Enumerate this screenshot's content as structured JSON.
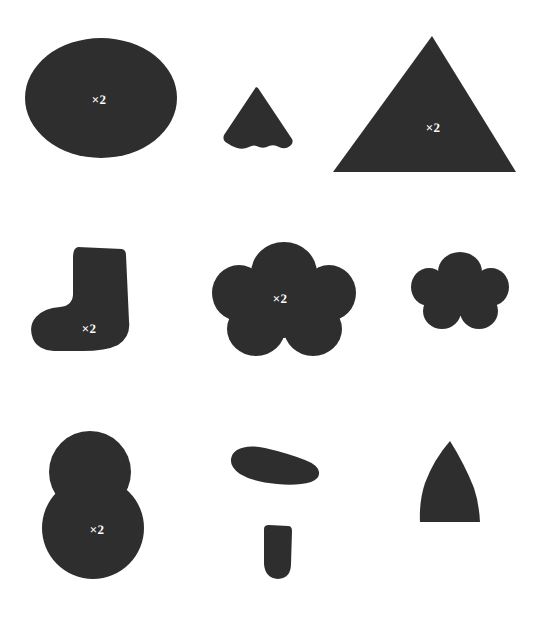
{
  "sheet": {
    "title": "Pattern Pieces Cutting Layout",
    "background_color": "#ffffff",
    "piece_fill_color": "#2e2e2e",
    "label_color": "#ffffff",
    "width": 540,
    "height": 619
  },
  "pieces": [
    {
      "id": "piece-ellipse",
      "name": "ellipse-piece",
      "row": 1,
      "column": 1,
      "shape": "ellipse",
      "quantity_label": "×2",
      "bbox": {
        "x": 25,
        "y": 38,
        "w": 152,
        "h": 120
      },
      "label_position": {
        "x": 99,
        "y": 99
      }
    },
    {
      "id": "piece-scalloped-cone",
      "name": "scalloped-cone-piece",
      "row": 1,
      "column": 2,
      "shape": "scalloped-cone",
      "quantity_label": "",
      "bbox": {
        "x": 218,
        "y": 87,
        "w": 78,
        "h": 64
      },
      "label_position": null
    },
    {
      "id": "piece-triangle",
      "name": "triangle-piece",
      "row": 1,
      "column": 3,
      "shape": "triangle",
      "quantity_label": "×2",
      "bbox": {
        "x": 333,
        "y": 36,
        "w": 183,
        "h": 137
      },
      "label_position": {
        "x": 433,
        "y": 127
      }
    },
    {
      "id": "piece-boot",
      "name": "boot-sock-piece",
      "row": 2,
      "column": 1,
      "shape": "boot",
      "quantity_label": "×2",
      "bbox": {
        "x": 30,
        "y": 247,
        "w": 102,
        "h": 104
      },
      "label_position": {
        "x": 89,
        "y": 328
      }
    },
    {
      "id": "piece-flower-large",
      "name": "large-flower-piece",
      "row": 2,
      "column": 2,
      "shape": "flower-5-petal",
      "quantity_label": "×2",
      "bbox": {
        "x": 213,
        "y": 240,
        "w": 142,
        "h": 116
      },
      "label_position": {
        "x": 280,
        "y": 298
      }
    },
    {
      "id": "piece-flower-small",
      "name": "small-flower-piece",
      "row": 2,
      "column": 3,
      "shape": "flower-5-petal",
      "quantity_label": "",
      "bbox": {
        "x": 412,
        "y": 251,
        "w": 96,
        "h": 78
      },
      "label_position": null
    },
    {
      "id": "piece-snowman",
      "name": "double-circle-snowman-piece",
      "row": 3,
      "column": 1,
      "shape": "two-stacked-circles",
      "quantity_label": "×2",
      "bbox": {
        "x": 42,
        "y": 431,
        "w": 102,
        "h": 148
      },
      "label_position": {
        "x": 97,
        "y": 529
      }
    },
    {
      "id": "piece-crescent",
      "name": "crescent-lip-piece",
      "row": 3,
      "column": 2,
      "shape": "crescent",
      "quantity_label": "",
      "bbox": {
        "x": 231,
        "y": 446,
        "w": 88,
        "h": 39
      },
      "label_position": null
    },
    {
      "id": "piece-tongue",
      "name": "rounded-tab-piece",
      "row": 3,
      "column": 2,
      "shape": "rounded-tab",
      "quantity_label": "",
      "bbox": {
        "x": 262,
        "y": 524,
        "w": 31,
        "h": 55
      },
      "label_position": null
    },
    {
      "id": "piece-arch",
      "name": "pointed-arch-piece",
      "row": 3,
      "column": 3,
      "shape": "pointed-arch",
      "quantity_label": "",
      "bbox": {
        "x": 419,
        "y": 441,
        "w": 61,
        "h": 82
      },
      "label_position": null
    }
  ]
}
